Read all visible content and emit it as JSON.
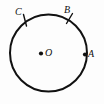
{
  "figure": {
    "type": "geometry-diagram",
    "canvas": {
      "width": 104,
      "height": 104,
      "background": "#fdfdfd"
    },
    "stroke_color": "#111111",
    "circle": {
      "name": "circle",
      "center_x": 48.5,
      "center_y": 53,
      "radius": 38.5,
      "stroke_width": 2
    },
    "points": [
      {
        "id": "O",
        "label": "O",
        "role": "center",
        "dot": true,
        "dot_x": 41,
        "dot_y": 53.5,
        "dot_radius": 2.1,
        "label_x": 45,
        "label_y": 48
      },
      {
        "id": "A",
        "label": "A",
        "role": "on-circle",
        "dot": true,
        "dot_x": 85,
        "dot_y": 54.5,
        "dot_radius": 2.1,
        "label_x": 88,
        "label_y": 49
      },
      {
        "id": "B",
        "label": "B",
        "role": "on-circle",
        "dot": false,
        "tick": {
          "x1": 72.5,
          "y1": 13.5,
          "x2": 66.5,
          "y2": 23.5
        },
        "label_x": 64,
        "label_y": 5
      },
      {
        "id": "C",
        "label": "C",
        "role": "on-circle",
        "dot": false,
        "tick": {
          "x1": 23.5,
          "y1": 14.5,
          "x2": 26.5,
          "y2": 26
        },
        "label_x": 15,
        "label_y": 7
      }
    ]
  }
}
